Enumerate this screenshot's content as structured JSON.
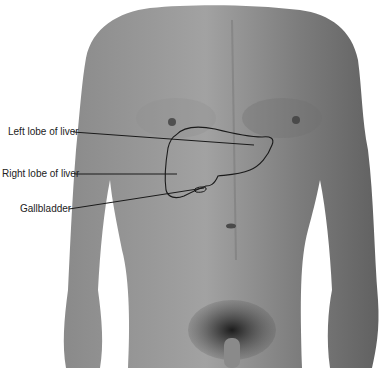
{
  "figure": {
    "colors": {
      "background": "#ffffff",
      "skin_light": "#9a9a9a",
      "skin_mid": "#808080",
      "skin_dark": "#5e5e5e",
      "outline": "#1a1a1a",
      "label_text": "#222222"
    }
  },
  "labels": [
    {
      "text": "Left lobe of liver",
      "x": 8,
      "y": 128
    },
    {
      "text": "Right lobe of liver",
      "x": 2,
      "y": 168
    },
    {
      "text": "Gallbladder",
      "x": 20,
      "y": 203
    }
  ]
}
